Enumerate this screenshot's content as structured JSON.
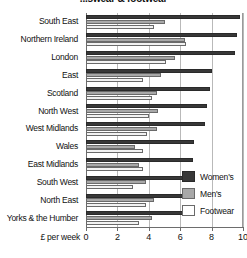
{
  "chart_data": {
    "type": "bar",
    "orientation": "horizontal",
    "title": "...swear & footwear",
    "xlabel": "£ per week",
    "ylabel": "",
    "xlim": [
      0,
      10
    ],
    "xticks": [
      0,
      2,
      4,
      6,
      8,
      10
    ],
    "xtick_labels": [
      "0",
      "2",
      "4",
      "6",
      "8",
      "10"
    ],
    "grid": true,
    "grid_axis": "x",
    "legend_position": "inside-bottom-right",
    "categories": [
      "South East",
      "Northern Ireland",
      "London",
      "East",
      "Scotland",
      "North West",
      "West Midlands",
      "Wales",
      "East Midlands",
      "South West",
      "North East",
      "Yorks & the Humber"
    ],
    "series": [
      {
        "name": "Women's",
        "color": "#383838",
        "values": [
          9.8,
          9.6,
          9.5,
          8.0,
          7.9,
          7.7,
          7.6,
          6.9,
          6.8,
          6.6,
          6.5,
          6.2
        ]
      },
      {
        "name": "Men's",
        "color": "#a8a8a8",
        "values": [
          5.0,
          6.3,
          5.7,
          4.8,
          4.5,
          4.6,
          4.5,
          3.1,
          3.4,
          3.8,
          4.3,
          4.2
        ]
      },
      {
        "name": "Footwear",
        "color": "#f2f2f2",
        "values": [
          4.3,
          6.4,
          5.1,
          3.6,
          4.2,
          4.0,
          3.9,
          3.6,
          3.6,
          3.0,
          3.8,
          3.4
        ]
      }
    ]
  },
  "legend": {
    "items": [
      {
        "label": "Women's",
        "key": "women"
      },
      {
        "label": "Men's",
        "key": "men"
      },
      {
        "label": "Footwear",
        "key": "footwear"
      }
    ]
  }
}
